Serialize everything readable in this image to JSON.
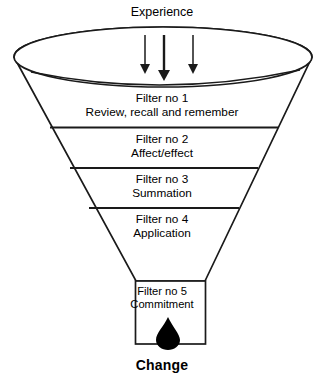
{
  "diagram": {
    "type": "funnel",
    "title_top": "Experience",
    "outcome_label": "Change",
    "background_color": "#ffffff",
    "line_color": "#1a1a1a",
    "drop_color": "#000000",
    "arrows_count": 3,
    "stages": [
      {
        "id": "filter-1",
        "number": "Filter no 1",
        "description": "Review, recall and remember"
      },
      {
        "id": "filter-2",
        "number": "Filter no 2",
        "description": "Affect/effect"
      },
      {
        "id": "filter-3",
        "number": "Filter no 3",
        "description": "Summation"
      },
      {
        "id": "filter-4",
        "number": "Filter no 4",
        "description": "Application"
      },
      {
        "id": "filter-5",
        "number": "Filter no 5",
        "description": "Commitment"
      }
    ]
  }
}
